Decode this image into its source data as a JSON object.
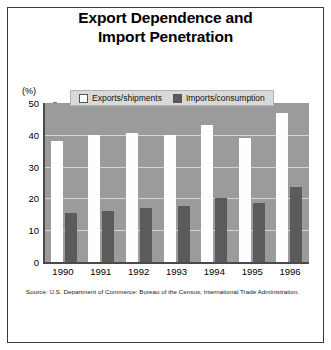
{
  "chart_data": {
    "type": "bar",
    "title": "Export Dependence and Import Penetration",
    "title_lines": [
      "Export Dependence and",
      "Import Penetration"
    ],
    "xlabel": "",
    "ylabel": "(%)",
    "categories": [
      "1990",
      "1991",
      "1992",
      "1993",
      "1994",
      "1995",
      "1996"
    ],
    "series": [
      {
        "name": "Exports/shipments",
        "color": "#ffffff",
        "values": [
          38,
          40,
          40.5,
          40,
          43,
          39,
          47
        ]
      },
      {
        "name": "Imports/consumption",
        "color": "#5b5b5b",
        "values": [
          15.5,
          16,
          17,
          17.5,
          20,
          18.5,
          23.5
        ]
      }
    ],
    "ylim": [
      0,
      50
    ],
    "yticks": [
      0,
      10,
      20,
      30,
      40,
      50
    ],
    "ytick_labels": [
      "0",
      "10",
      "20",
      "30",
      "40",
      "50"
    ],
    "grid": true,
    "grid_color": "#d5d5d5",
    "plot_background": "#9b9b9b",
    "legend_position": "top-center",
    "legend_background": "#d9d9d9",
    "source": "Source: U.S. Department of Commerce: Bureau of the Census; International Trade Administration."
  }
}
